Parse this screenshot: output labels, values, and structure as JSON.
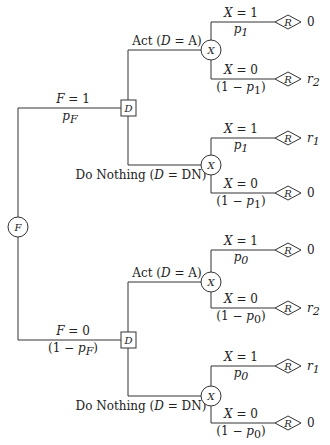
{
  "diagram": {
    "type": "decision-tree",
    "root": {
      "kind": "chance",
      "symbol": "F"
    },
    "branches_F": [
      {
        "label": "F = 1",
        "prob": "p_F"
      },
      {
        "label": "F = 0",
        "prob": "(1 − p_F)"
      }
    ],
    "decision_symbol": "D",
    "chance_symbol": "X",
    "reward_symbol": "R",
    "actions": [
      {
        "label": "Act (D = A)"
      },
      {
        "label": "Do Nothing (D = DN)"
      }
    ],
    "labels": {
      "F1": "F = 1",
      "pF": "p",
      "pF_sub": "F",
      "F0": "F = 0",
      "one_minus_pF_pre": "(1 − p",
      "one_minus_pF_sub": "F",
      "one_minus_pF_post": ")",
      "act_pre": "Act (",
      "act_var": "D",
      "act_post": " = A)",
      "dn_pre": "Do Nothing (",
      "dn_var": "D",
      "dn_post": " = DN)",
      "X1": "X = 1",
      "X0": "X = 0",
      "p": "p",
      "one_minus_pre": "(1 − ",
      "one_minus_post": ")",
      "sub1": "1",
      "sub0": "0",
      "F": "F",
      "D": "D",
      "X": "X",
      "R": "R"
    },
    "leaves": [
      {
        "F": 1,
        "D": "A",
        "X": 1,
        "prob": "p1",
        "reward": "0",
        "reward_var": "",
        "reward_sub": ""
      },
      {
        "F": 1,
        "D": "A",
        "X": 0,
        "prob": "(1 − p1)",
        "reward": "",
        "reward_var": "r",
        "reward_sub": "2"
      },
      {
        "F": 1,
        "D": "DN",
        "X": 1,
        "prob": "p1",
        "reward": "",
        "reward_var": "r",
        "reward_sub": "1"
      },
      {
        "F": 1,
        "D": "DN",
        "X": 0,
        "prob": "(1 − p1)",
        "reward": "0",
        "reward_var": "",
        "reward_sub": ""
      },
      {
        "F": 0,
        "D": "A",
        "X": 1,
        "prob": "p0",
        "reward": "0",
        "reward_var": "",
        "reward_sub": ""
      },
      {
        "F": 0,
        "D": "A",
        "X": 0,
        "prob": "(1 − p0)",
        "reward": "",
        "reward_var": "r",
        "reward_sub": "2"
      },
      {
        "F": 0,
        "D": "DN",
        "X": 1,
        "prob": "p0",
        "reward": "",
        "reward_var": "r",
        "reward_sub": "1"
      },
      {
        "F": 0,
        "D": "DN",
        "X": 0,
        "prob": "(1 − p0)",
        "reward": "0",
        "reward_var": "",
        "reward_sub": ""
      }
    ]
  }
}
